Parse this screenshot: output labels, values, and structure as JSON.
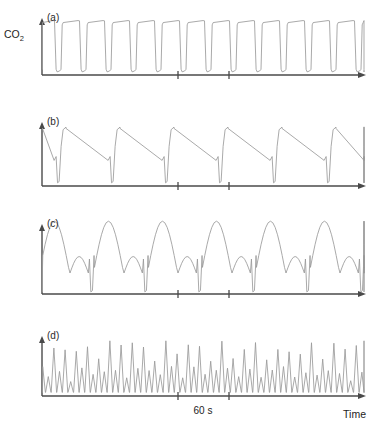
{
  "figure": {
    "y_axis_label": "CO",
    "y_axis_label_sub": "2",
    "x_axis_label": "Time",
    "scale_bar_label": "60 s"
  },
  "panels": [
    {
      "id": "a",
      "label": "(a)",
      "description": "normal capnogram, regular square-wave plateaus",
      "axis_top": 18,
      "baseline": 75,
      "x_start": 42,
      "x_end": 366,
      "ticks": [
        178,
        229
      ]
    },
    {
      "id": "b",
      "label": "(b)",
      "description": "slow ramp decline with deep notch and sharp rise, sawtooth",
      "axis_top": 122,
      "baseline": 186,
      "x_start": 42,
      "x_end": 366,
      "ticks": [
        178,
        229
      ]
    },
    {
      "id": "c",
      "label": "(c)",
      "description": "alternating large and small humps with deep narrow spikes",
      "axis_top": 224,
      "baseline": 294,
      "x_start": 42,
      "x_end": 366,
      "ticks": [
        178,
        229
      ]
    },
    {
      "id": "d",
      "label": "(d)",
      "description": "rapid irregular oscillations, alternating tall and short peaks",
      "axis_top": 336,
      "baseline": 396,
      "x_start": 42,
      "x_end": 366,
      "ticks": [
        178,
        229
      ]
    }
  ],
  "chart_data": {
    "type": "line",
    "title": "",
    "xlabel": "Time",
    "ylabel": "CO2",
    "grid": false,
    "legend": "none",
    "x_scale_bar_seconds": 60,
    "x_scale_bar_px": [
      178,
      229
    ],
    "series": [
      {
        "name": "(a)",
        "panel": "a",
        "waveform": "capnogram-plateau",
        "cycles": 13,
        "period_px": 25,
        "plateau_fraction": 0.74,
        "amplitude_rel": 1.0,
        "notch_depth_rel": 0.97
      },
      {
        "name": "(b)",
        "panel": "b",
        "waveform": "sawtooth-decline-with-notch",
        "cycles": 6,
        "period_px": 54,
        "amplitude_rel": 1.0,
        "notch_depth_rel": 1.0,
        "ramp_fraction": 0.78
      },
      {
        "name": "(c)",
        "panel": "c",
        "waveform": "alternating-hump-with-spike",
        "cycles": 6,
        "period_px": 54,
        "large_hump_rel": 1.0,
        "small_hump_rel": 0.56,
        "spike_depth_rel": 1.0
      },
      {
        "name": "(d)",
        "panel": "d",
        "waveform": "rapid-irregular-oscillation",
        "cycles": 58,
        "period_px": 5.6,
        "tall_peak_rel": 1.0,
        "short_peak_rel": 0.45
      }
    ]
  }
}
